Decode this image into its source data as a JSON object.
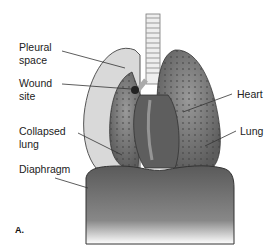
{
  "figure": {
    "panel_label": "A.",
    "labels": {
      "pleural_space": "Pleural space",
      "pleural_space_line1": "Pleural",
      "pleural_space_line2": "space",
      "wound_site_line1": "Wound",
      "wound_site_line2": "site",
      "collapsed_lung_line1": "Collapsed",
      "collapsed_lung_line2": "lung",
      "diaphragm": "Diaphragm",
      "heart": "Heart",
      "lung": "Lung"
    },
    "colors": {
      "pleural_space": "#d9d9d9",
      "lung_tissue": "#7a7a7a",
      "heart": "#5e5e5e",
      "diaphragm": "#6b6b6b",
      "trachea": "#e6e6e6",
      "outline": "#444444"
    }
  }
}
